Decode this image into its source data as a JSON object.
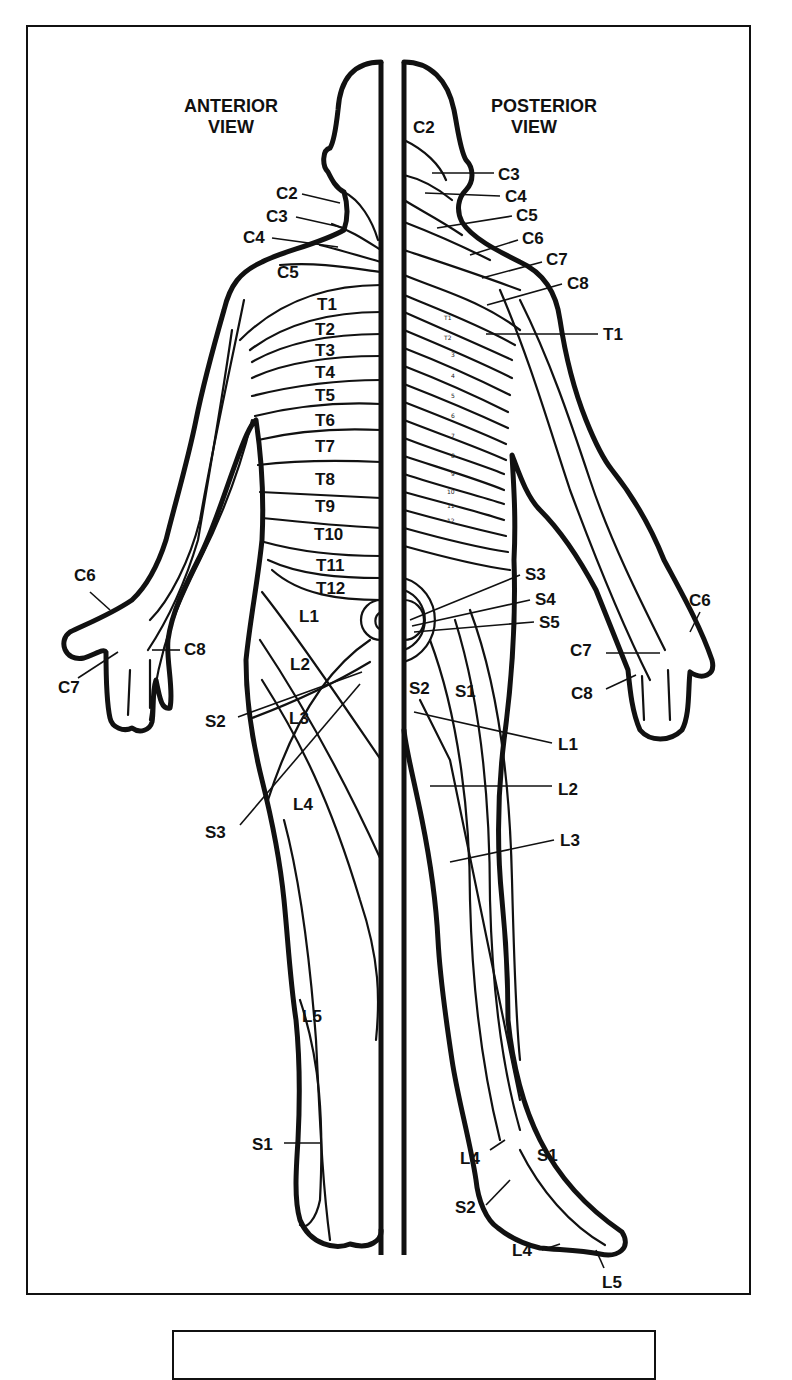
{
  "diagram": {
    "type": "dermatome-map",
    "views": {
      "anterior": {
        "title_line1": "ANTERIOR",
        "title_line2": "VIEW"
      },
      "posterior": {
        "title_line1": "POSTERIOR",
        "title_line2": "VIEW"
      }
    },
    "anterior_labels": {
      "neck": [
        "C2",
        "C3",
        "C4"
      ],
      "shoulder": "C5",
      "trunk": [
        "T1",
        "T2",
        "T3",
        "T4",
        "T5",
        "T6",
        "T7",
        "T8",
        "T9",
        "T10",
        "T11",
        "T12"
      ],
      "hand": [
        "C6",
        "C7",
        "C8"
      ],
      "groin_leg": [
        "L1",
        "L2",
        "L3",
        "L4",
        "L5"
      ],
      "sacral": [
        "S2",
        "S3"
      ],
      "foot": "S1"
    },
    "posterior_labels": {
      "head": "C2",
      "neck": [
        "C3",
        "C4",
        "C5",
        "C6",
        "C7",
        "C8"
      ],
      "arm": "T1",
      "spine_small": [
        "T1",
        "T2",
        "3",
        "4",
        "5",
        "6",
        "7",
        "8",
        "9",
        "10",
        "11",
        "12"
      ],
      "sacral": [
        "S3",
        "S4",
        "S5"
      ],
      "buttock": [
        "S2",
        "S1"
      ],
      "hand": [
        "C6",
        "C7",
        "C8"
      ],
      "leg": [
        "L1",
        "L2",
        "L3"
      ],
      "foot": [
        "L4",
        "S1",
        "S2",
        "L4",
        "L5"
      ]
    },
    "caption": ""
  }
}
